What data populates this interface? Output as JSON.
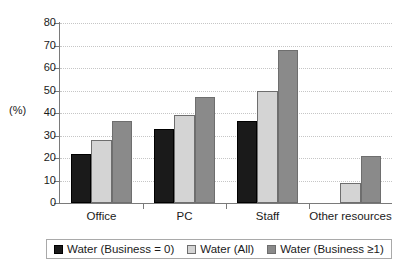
{
  "chart_data": {
    "type": "bar",
    "title": "",
    "subtitle": "",
    "xlabel": "",
    "ylabel": "(%)",
    "ylim": [
      0,
      80
    ],
    "yticks": [
      0,
      10,
      20,
      30,
      40,
      50,
      60,
      70,
      80
    ],
    "grid": true,
    "legend_position": "bottom",
    "categories": [
      "Office",
      "PC",
      "Staff",
      "Other resources"
    ],
    "series": [
      {
        "name": "Water (Business = 0)",
        "color": "#1a1a1a",
        "values": [
          22,
          33,
          36.5,
          0
        ]
      },
      {
        "name": "Water (All)",
        "color": "#d4d4d4",
        "values": [
          28,
          39,
          50,
          9
        ]
      },
      {
        "name": "Water (Business ≥1)",
        "color": "#8a8a8a",
        "values": [
          36.5,
          47,
          68,
          21
        ]
      }
    ]
  },
  "axis": {
    "y_unit_label": "(%)"
  },
  "colors": {
    "series_1": "#1a1a1a",
    "series_2": "#d4d4d4",
    "series_3": "#8a8a8a",
    "axis": "#7a7a7a",
    "grid": "#c6c6c6",
    "bar_outline": "#6e6e6e",
    "background": "#ffffff"
  }
}
